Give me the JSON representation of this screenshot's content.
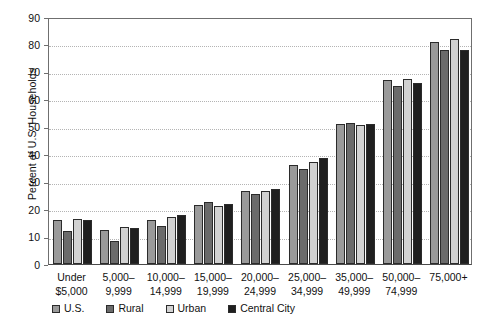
{
  "chart_data": {
    "type": "bar",
    "title": "",
    "xlabel": "",
    "ylabel": "Percent of U.S. Households",
    "ylim": [
      0,
      90
    ],
    "ytick_step": 10,
    "yticks": [
      0,
      10,
      20,
      30,
      40,
      50,
      60,
      70,
      80,
      90
    ],
    "grid": true,
    "grid_style": "dotted-horizontal",
    "legend_position": "bottom",
    "categories": [
      "Under\n$5,000",
      "5,000–\n9,999",
      "10,000–\n14,999",
      "15,000–\n19,999",
      "20,000–\n24,999",
      "25,000–\n34,999",
      "35,000–\n49,999",
      "50,000–\n74,999",
      "75,000+"
    ],
    "category_lines": [
      [
        "Under",
        "$5,000"
      ],
      [
        "5,000–",
        "9,999"
      ],
      [
        "10,000–",
        "14,999"
      ],
      [
        "15,000–",
        "19,999"
      ],
      [
        "20,000–",
        "24,999"
      ],
      [
        "25,000–",
        "34,999"
      ],
      [
        "35,000–",
        "49,999"
      ],
      [
        "50,000–",
        "74,999"
      ],
      [
        "75,000+",
        ""
      ]
    ],
    "series": [
      {
        "name": "U.S.",
        "color": "#9a9a9a",
        "values": [
          16,
          12.5,
          16,
          21.5,
          26.5,
          36,
          51,
          67,
          81
        ]
      },
      {
        "name": "Rural",
        "color": "#6b6b6b",
        "values": [
          12,
          8.5,
          14,
          22.5,
          25.5,
          34.5,
          51.5,
          65,
          78
        ]
      },
      {
        "name": "Urban",
        "color": "#d2d2d2",
        "values": [
          16.5,
          13.5,
          17,
          21,
          26.5,
          37,
          50.5,
          67.5,
          82
        ]
      },
      {
        "name": "Central City",
        "color": "#1f1f1f",
        "values": [
          16,
          13,
          18,
          22,
          27.5,
          38.5,
          51,
          66,
          78
        ]
      }
    ]
  },
  "legend": {
    "items": [
      {
        "label": "U.S.",
        "color": "#9a9a9a"
      },
      {
        "label": "Rural",
        "color": "#6b6b6b"
      },
      {
        "label": "Urban",
        "color": "#d2d2d2"
      },
      {
        "label": "Central City",
        "color": "#1f1f1f"
      }
    ]
  }
}
